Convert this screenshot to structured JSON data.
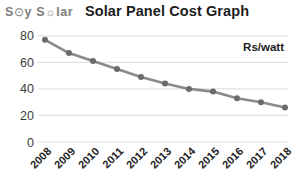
{
  "logo": {
    "part1": "S",
    "sun1": "⊙",
    "part2": "y S",
    "sun2": "☼",
    "part3": "lar",
    "color": "#7d7d7d"
  },
  "chart_data": {
    "type": "line",
    "title": "Solar Panel Cost Graph",
    "unit_label": "Rs/watt",
    "categories": [
      "2008",
      "2009",
      "2010",
      "2011",
      "2012",
      "2013",
      "2014",
      "2015",
      "2016",
      "2017",
      "2018"
    ],
    "values": [
      77,
      67,
      61,
      55,
      49,
      44,
      40,
      38,
      33,
      30,
      26
    ],
    "xlabel": "",
    "ylabel": "",
    "ylim": [
      0,
      80
    ],
    "yticks": [
      0,
      20,
      40,
      60,
      80
    ],
    "grid": "horizontal only",
    "legend_position": "top-right annotation",
    "colors": {
      "line": "#8a8a8a",
      "marker": "#6b6b6b",
      "grid": "#e0e0e0",
      "y_tick_text": "#3c3c3c",
      "x_tick_text": "#1f1f1f",
      "annotation_text": "#1c1c1c"
    }
  }
}
